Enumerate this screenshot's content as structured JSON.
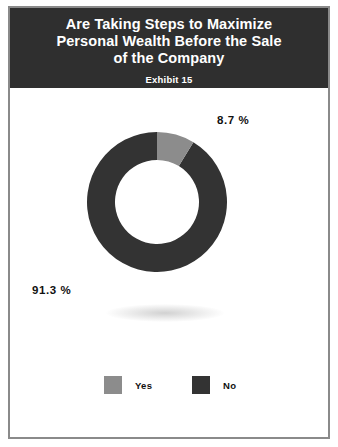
{
  "header": {
    "title": "Are Taking Steps to Maximize\nPersonal Wealth Before the Sale\nof the Company",
    "subtitle": "Exhibit 15",
    "background_color": "#2f2f2f",
    "text_color": "#ffffff"
  },
  "labels": {
    "yes_pct": "8.7 %",
    "no_pct": "91.3 %"
  },
  "legend": {
    "items": [
      {
        "label": "Yes",
        "color": "#8c8c8c"
      },
      {
        "label": "No",
        "color": "#333333"
      }
    ]
  },
  "chart_data": {
    "type": "pie",
    "variant": "donut",
    "title": "Are Taking Steps to Maximize Personal Wealth Before the Sale of the Company",
    "subtitle": "Exhibit 15",
    "categories": [
      "Yes",
      "No"
    ],
    "values": [
      8.7,
      91.3
    ],
    "value_labels": [
      "8.7 %",
      "91.3 %"
    ],
    "colors": [
      "#8c8c8c",
      "#333333"
    ],
    "units": "percent",
    "start_angle_deg": 0,
    "direction": "clockwise",
    "inner_radius_ratio": 0.6,
    "legend_position": "bottom",
    "grid": false,
    "xlabel": "",
    "ylabel": ""
  }
}
